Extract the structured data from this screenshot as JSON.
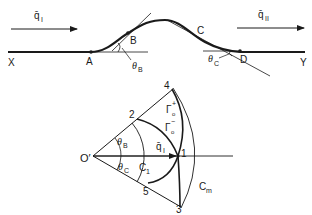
{
  "upper_figure": {
    "labels": {
      "X": "X",
      "A": "A",
      "B": "B",
      "C": "C",
      "D": "D",
      "Y": "Y",
      "theta_B": "θ",
      "theta_B_sub": "B",
      "theta_C": "θ",
      "theta_C_sub": "C",
      "q_in": "q̄",
      "q_in_sub": "I",
      "q_out": "q̄",
      "q_out_sub": "II"
    }
  },
  "lower_figure": {
    "labels": {
      "origin": "O′",
      "p1": "1",
      "p2": "2",
      "p3": "3",
      "p4": "4",
      "p5": "5",
      "theta_B": "θ",
      "theta_B_sub": "B",
      "theta_C": "θ",
      "theta_C_sub": "C",
      "C1": "C",
      "C1_sub": "1",
      "Cm": "C",
      "Cm_sub": "m",
      "q": "q̄",
      "q_sub": "I",
      "gamma_plus": "Γ",
      "gamma_plus_sub": "o",
      "gamma_plus_sup": "+",
      "gamma_minus": "Γ",
      "gamma_minus_sub": "o",
      "gamma_minus_sup": "−"
    }
  },
  "colors": {
    "ink": "#1a1a1a",
    "background": "#ffffff"
  }
}
